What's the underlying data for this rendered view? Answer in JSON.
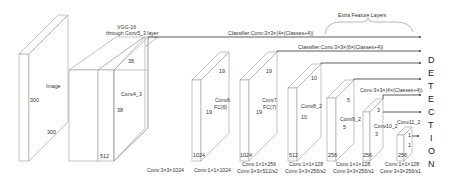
{
  "diagram": {
    "title_vgg": [
      "VGG-16",
      "through Conv5_3 layer"
    ],
    "extra_layers_title": "Extra Feature Layers",
    "detection_letters": [
      "D",
      "E",
      "T",
      "E",
      "C",
      "T",
      "I",
      "O",
      "N"
    ],
    "input": {
      "name": "Image",
      "height": "300",
      "width": "300"
    },
    "layers": [
      {
        "id": "conv4_3",
        "name": "Conv4_3",
        "top": "38",
        "side": "38",
        "channels": "512",
        "op": "Conv:3×3×1024"
      },
      {
        "id": "conv6",
        "name": "Conv6",
        "sub": "FC(6)",
        "top": "19",
        "side": "19",
        "channels": "1024",
        "op": "Conv:1×1×1024"
      },
      {
        "id": "conv7",
        "name": "Conv7",
        "sub": "FC(7)",
        "top": "19",
        "side": "19",
        "channels": "1024",
        "op": "Conv:1×1×256",
        "op2": "Conv:3×3×512/s2"
      },
      {
        "id": "conv8_2",
        "name": "Conv8_2",
        "top": "10",
        "side": "10",
        "channels": "512",
        "op": "Conv:1×1×128",
        "op2": "Conv:3×3×256/s2"
      },
      {
        "id": "conv9_2",
        "name": "Conv9_2",
        "top": "5",
        "side": "5",
        "channels": "256",
        "op": "Conv:1×1×128",
        "op2": "Conv:3×3×256/s1"
      },
      {
        "id": "conv10_2",
        "name": "Conv10_2",
        "top": "3",
        "side": "3",
        "channels": "256",
        "op": "Conv:1×1×128",
        "op2": "Conv:3×3×256/s1"
      },
      {
        "id": "conv11_2",
        "name": "Conv11_2",
        "top": "1",
        "side": "1",
        "channels": "256"
      }
    ],
    "classifiers": [
      "Classifier:Conv:3×3×(4×(Classes+4))",
      "Classifier:Conv:3×3×(6×(Classes+4))",
      "Conv:3×3×(4×(Classes+4))"
    ],
    "colors": {
      "line": "#9a9a9a",
      "arrow": "#333333",
      "text": "#333333"
    }
  }
}
